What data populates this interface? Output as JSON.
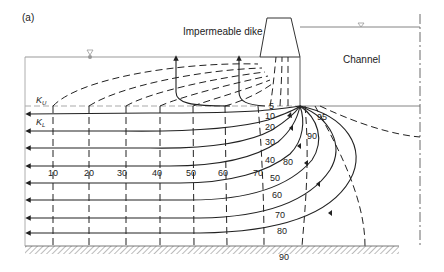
{
  "figure": {
    "panel_label": "(a)",
    "dike_label": "Impermeable dike",
    "channel_label": "Channel",
    "upper_layer_label": "K",
    "upper_layer_sub": "U",
    "lower_layer_label": "K",
    "lower_layer_sub": "L",
    "equipotential_labels_bottom": [
      "10",
      "20",
      "30",
      "40",
      "50",
      "60",
      "70"
    ],
    "equipotential_labels_inner": [
      "80",
      "90",
      "95"
    ],
    "flowline_labels": [
      "5",
      "10",
      "20",
      "30",
      "40",
      "50",
      "60",
      "70",
      "80",
      "90"
    ],
    "colors": {
      "ink": "#222222",
      "gray": "#9a9a9a",
      "background": "#ffffff"
    }
  }
}
